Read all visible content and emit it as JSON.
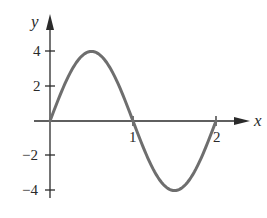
{
  "chart_data": {
    "type": "line",
    "title": "",
    "xlabel": "x",
    "ylabel": "y",
    "function": "y = 4 sin(πx)",
    "xlim": [
      0,
      2
    ],
    "ylim": [
      -4,
      4
    ],
    "x_ticks": [
      "1",
      "2"
    ],
    "y_ticks": [
      "4",
      "2",
      "−2",
      "−4"
    ],
    "grid": false,
    "legend": null,
    "series": [
      {
        "name": "curve",
        "x": [
          0,
          0.25,
          0.5,
          0.75,
          1,
          1.25,
          1.5,
          1.75,
          2
        ],
        "values": [
          0,
          2.83,
          4,
          2.83,
          0,
          -2.83,
          -4,
          -2.83,
          0
        ],
        "color": "#6e6e6e"
      }
    ]
  },
  "colors": {
    "axis": "#2a2a2a",
    "curve": "#6e6e6e",
    "background": "#ffffff"
  }
}
